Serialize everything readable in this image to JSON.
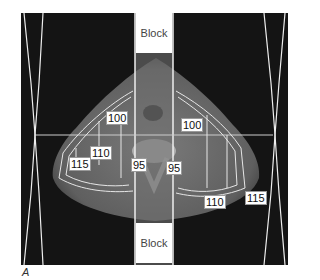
{
  "figure": {
    "caption": "A",
    "blocks": {
      "top_label": "Block",
      "bottom_label": "Block"
    },
    "isodose_labels": [
      {
        "value": "100",
        "side": "left"
      },
      {
        "value": "100",
        "side": "right"
      },
      {
        "value": "110",
        "side": "left"
      },
      {
        "value": "110",
        "side": "right"
      },
      {
        "value": "115",
        "side": "left"
      },
      {
        "value": "115",
        "side": "right"
      },
      {
        "value": "95",
        "side": "left"
      },
      {
        "value": "95",
        "side": "right"
      }
    ],
    "colors": {
      "background": "#141414",
      "contour": "#e6e6e6",
      "tissue": "#6a6a6a",
      "block": "#ffffff"
    }
  }
}
